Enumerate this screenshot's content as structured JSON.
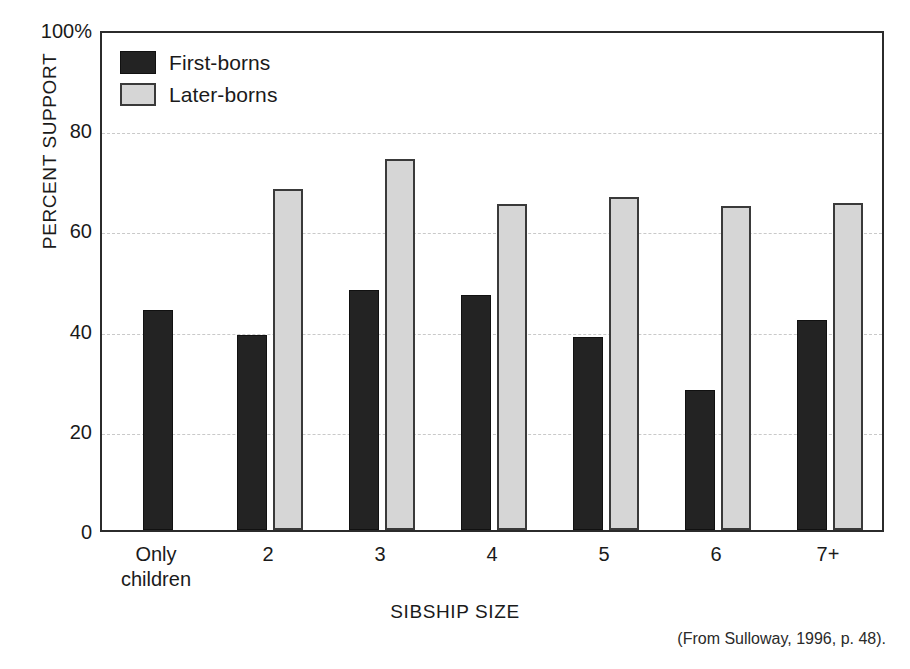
{
  "figure": {
    "source_note": "(From Sulloway, 1996, p. 48)."
  },
  "legend": {
    "position": "inside-top-left",
    "entries": [
      {
        "label": "First-borns",
        "color": "#232323",
        "key": "first"
      },
      {
        "label": "Later-borns",
        "color": "#d6d6d6",
        "key": "later"
      }
    ]
  },
  "axes": {
    "y": {
      "label": "PERCENT SUPPORT",
      "ticks": [
        "100%",
        "80",
        "60",
        "40",
        "20",
        "0"
      ],
      "tick_values": [
        100,
        80,
        60,
        40,
        20,
        0
      ],
      "min": 0,
      "max": 100
    },
    "x": {
      "label": "SIBSHIP SIZE",
      "ticks": [
        "Only\nchildren",
        "2",
        "3",
        "4",
        "5",
        "6",
        "7+"
      ]
    }
  },
  "chart_data": {
    "type": "bar",
    "title": "",
    "xlabel": "SIBSHIP SIZE",
    "ylabel": "PERCENT SUPPORT",
    "ylim": [
      0,
      100
    ],
    "grid": true,
    "legend_position": "inside-top-left",
    "categories": [
      "Only children",
      "2",
      "3",
      "4",
      "5",
      "6",
      "7+"
    ],
    "series": [
      {
        "name": "First-borns",
        "color": "#232323",
        "values": [
          44,
          39,
          48,
          47,
          38.5,
          28,
          42
        ]
      },
      {
        "name": "Later-borns",
        "color": "#d6d6d6",
        "values": [
          null,
          68,
          74,
          65,
          66.5,
          64.7,
          65.3
        ]
      }
    ],
    "annotations": [
      "(From Sulloway, 1996, p. 48)."
    ]
  }
}
